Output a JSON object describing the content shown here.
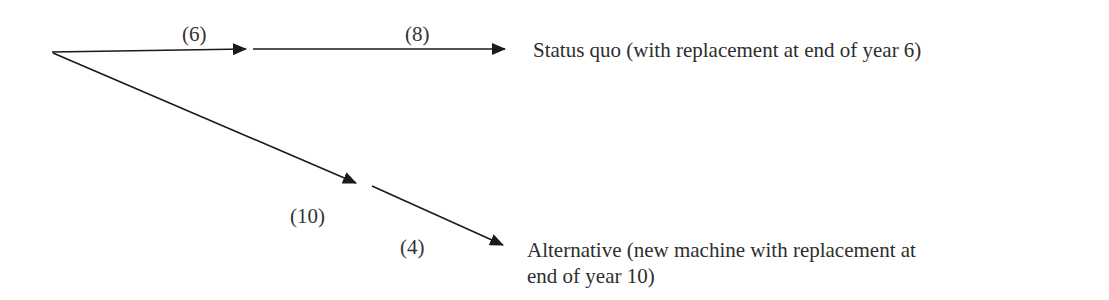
{
  "diagram": {
    "type": "decision-tree",
    "branches": [
      {
        "id": "status-quo",
        "segments": [
          {
            "label": "(6)",
            "years": 6
          },
          {
            "label": "(8)",
            "years": 8
          }
        ],
        "outcome": "Status quo (with replacement at end of year 6)"
      },
      {
        "id": "alternative",
        "segments": [
          {
            "label": "(10)",
            "years": 10
          },
          {
            "label": "(4)",
            "years": 4
          }
        ],
        "outcome_line1": "Alternative (new machine with replacement at",
        "outcome_line2": "end of year 10)"
      }
    ],
    "colors": {
      "line": "#1a1a1a",
      "text": "#2e2e2e",
      "background": "#ffffff"
    }
  }
}
